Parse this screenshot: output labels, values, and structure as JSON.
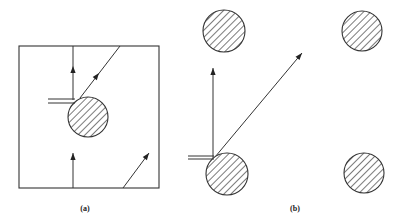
{
  "figure": {
    "background": "#ffffff",
    "stroke_color": "#333333",
    "hatch_color": "#333333",
    "panels": [
      {
        "id": "a",
        "label": "(a)",
        "label_pos": [
          85,
          209
        ],
        "description": "Single periodic unit cell (square box) containing one hatched circle; rays with arrows crossing the cell boundaries and a double line touching the circle",
        "box": {
          "x": 19,
          "y": 46,
          "width": 140,
          "height": 142
        },
        "circles": [
          {
            "cx": 88,
            "cy": 117,
            "r": 20
          }
        ],
        "double_line": {
          "x1": 48,
          "x2": 75,
          "y1": 99,
          "y2": 103
        },
        "arrows": [
          {
            "name": "vertical-ray-top",
            "x1": 73,
            "y1": 100,
            "x2": 73,
            "y2": 46,
            "head": [
              73,
              66
            ]
          },
          {
            "name": "diagonal-ray-top",
            "x1": 80,
            "y1": 98,
            "x2": 120,
            "y2": 46,
            "head": [
              99,
              73
            ]
          },
          {
            "name": "vertical-ray-bottom",
            "x1": 73,
            "y1": 188,
            "x2": 73,
            "y2": 153,
            "head": [
              73,
              153
            ]
          },
          {
            "name": "diagonal-ray-bottom",
            "x1": 123,
            "y1": 188,
            "x2": 149,
            "y2": 153,
            "head": [
              149,
              153
            ]
          }
        ]
      },
      {
        "id": "b",
        "label": "(b)",
        "label_pos": [
          295,
          209
        ],
        "description": "Equivalent unfolded lattice of four hatched circles; rays travel freely from one circle toward others",
        "circles": [
          {
            "cx": 224,
            "cy": 31,
            "r": 21
          },
          {
            "cx": 362,
            "cy": 31,
            "r": 20
          },
          {
            "cx": 227,
            "cy": 174,
            "r": 21
          },
          {
            "cx": 364,
            "cy": 173,
            "r": 20
          }
        ],
        "double_line": {
          "x1": 188,
          "x2": 214,
          "y1": 156,
          "y2": 159
        },
        "arrows": [
          {
            "name": "vertical-ray",
            "x1": 213,
            "y1": 158,
            "x2": 213,
            "y2": 68,
            "head": [
              213,
              68
            ]
          },
          {
            "name": "diagonal-ray",
            "x1": 215,
            "y1": 157,
            "x2": 302,
            "y2": 53,
            "head": [
              302,
              53
            ]
          }
        ]
      }
    ]
  }
}
